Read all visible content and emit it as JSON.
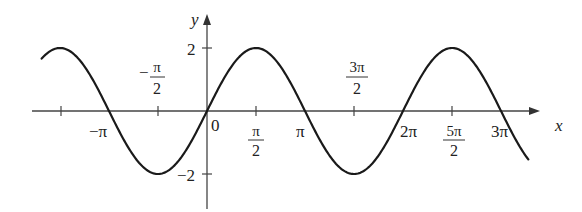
{
  "chart_data": {
    "type": "line",
    "title": "",
    "function": "y = 2 sin(x)",
    "xlabel": "x",
    "ylabel": "y",
    "xlim": [
      -5.3,
      10.3
    ],
    "ylim": [
      -3.1,
      3.1
    ],
    "grid": false,
    "legend": null,
    "x_ticks": [
      {
        "value": -4.712,
        "label": ""
      },
      {
        "value": -3.1416,
        "label": "−π"
      },
      {
        "value": -1.5708,
        "label": "−π/2",
        "num": "π",
        "den": "2",
        "sign": "−",
        "position": "above"
      },
      {
        "value": 0,
        "label": "0"
      },
      {
        "value": 1.5708,
        "label": "π/2",
        "num": "π",
        "den": "2",
        "position": "below"
      },
      {
        "value": 3.1416,
        "label": "π"
      },
      {
        "value": 4.7124,
        "label": "3π/2",
        "num": "3π",
        "den": "2",
        "position": "above"
      },
      {
        "value": 6.2832,
        "label": "2π"
      },
      {
        "value": 7.854,
        "label": "5π/2",
        "num": "5π",
        "den": "2",
        "position": "below"
      },
      {
        "value": 9.4248,
        "label": "3π"
      }
    ],
    "y_ticks": [
      {
        "value": 2,
        "label": "2"
      },
      {
        "value": -2,
        "label": "−2"
      }
    ],
    "series": [
      {
        "name": "2 sin x",
        "x": [
          -5.3,
          -4.712,
          -3.1416,
          -1.5708,
          0,
          1.5708,
          3.1416,
          4.7124,
          6.2832,
          7.854,
          9.4248,
          10.3
        ],
        "values": [
          1.66,
          2,
          0,
          -2,
          0,
          2,
          0,
          -2,
          0,
          2,
          0,
          -1.55
        ]
      }
    ]
  },
  "labels": {
    "x_axis": "x",
    "y_axis": "y",
    "origin": "0",
    "y_pos2": "2",
    "y_neg2": "−2",
    "neg_pi": "−π",
    "neg_half_pi_sign": "−",
    "neg_half_pi_num": "π",
    "neg_half_pi_den": "2",
    "half_pi_num": "π",
    "half_pi_den": "2",
    "pi": "π",
    "three_half_pi_num": "3π",
    "three_half_pi_den": "2",
    "two_pi": "2π",
    "five_half_pi_num": "5π",
    "five_half_pi_den": "2",
    "three_pi": "3π"
  }
}
